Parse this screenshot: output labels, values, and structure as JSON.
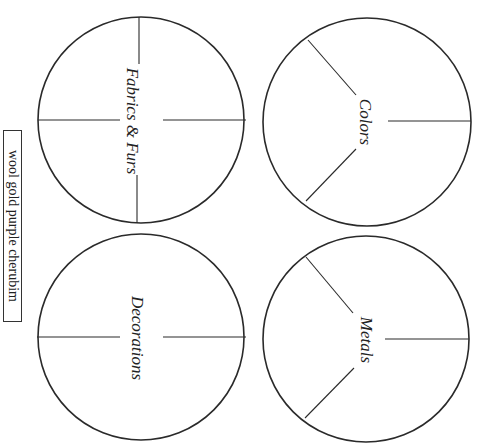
{
  "word_bank": {
    "text": "wool gold purple cherubim",
    "words": [
      "wool",
      "gold",
      "purple",
      "cherubim"
    ]
  },
  "circles": [
    {
      "id": "fabrics",
      "label": "Fabrics & Furs",
      "sections": 4
    },
    {
      "id": "colors",
      "label": "Colors",
      "sections": 3
    },
    {
      "id": "decorations",
      "label": "Decorations",
      "sections": 2
    },
    {
      "id": "metals",
      "label": "Metals",
      "sections": 3
    }
  ]
}
